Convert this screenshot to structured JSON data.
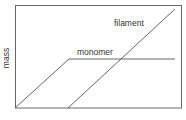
{
  "diagram": {
    "y_axis_label": "mass",
    "x_axis_label": "",
    "curves": [
      {
        "name": "monomer",
        "label": "monomer",
        "points": [
          [
            15,
            108
          ],
          [
            69,
            59
          ],
          [
            175,
            59
          ]
        ]
      },
      {
        "name": "filament",
        "label": "filament",
        "points": [
          [
            68,
            108
          ],
          [
            175,
            9
          ]
        ]
      }
    ],
    "colors": {
      "line": "#555555",
      "text": "#333333",
      "background": "#ffffff"
    }
  }
}
